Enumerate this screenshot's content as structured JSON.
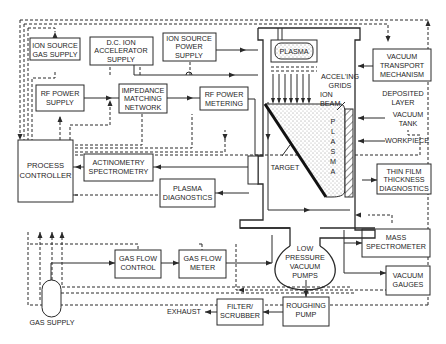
{
  "diagram": {
    "blocks": {
      "ion_source_gas_supply": [
        "ION SOURCE",
        "GAS SUPPLY"
      ],
      "dc_ion_accelerator_supply": [
        "D.C. ION",
        "ACCELERATOR",
        "SUPPLY"
      ],
      "ion_source_power_supply": [
        "ION SOURCE",
        "POWER",
        "SUPPLY"
      ],
      "rf_power_supply": [
        "RF POWER",
        "SUPPLY"
      ],
      "impedance_matching_network": [
        "IMPEDANCE",
        "MATCHING",
        "NETWORK"
      ],
      "rf_power_metering": [
        "RF POWER",
        "METERING"
      ],
      "vacuum_transport_mechanism": [
        "VACUUM",
        "TRANSPORT",
        "MECHANISM"
      ],
      "process_controller": [
        "PROCESS",
        "CONTROLLER"
      ],
      "actinometry_spectrometry": [
        "ACTINOMETRY",
        "SPECTROMETRY"
      ],
      "plasma_diagnostics": [
        "PLASMA",
        "DIAGNOSTICS"
      ],
      "thin_film_thickness_diagnostics": [
        "THIN FILM",
        "THICKNESS",
        "DIAGNOSTICS"
      ],
      "mass_spectrometer": [
        "MASS",
        "SPECTROMETER"
      ],
      "vacuum_gauges": [
        "VACUUM",
        "GAUGES"
      ],
      "gas_flow_control": [
        "GAS FLOW",
        "CONTROL"
      ],
      "gas_flow_meter": [
        "GAS FLOW",
        "METER"
      ],
      "low_pressure_vacuum_pumps": [
        "LOW",
        "PRESSURE",
        "VACUUM",
        "PUMPS"
      ],
      "roughing_pump": [
        "ROUGHING",
        "PUMP"
      ],
      "filter_scrubber": [
        "FILTER/",
        "SCRUBBER"
      ]
    },
    "labels": {
      "plasma_source": "PLASMA",
      "accel_grids": [
        "ACCEL'ING",
        "GRIDS"
      ],
      "ion_beam": [
        "ION",
        "BEAM"
      ],
      "deposited_layer": [
        "DEPOSITED",
        "LAYER"
      ],
      "vacuum_tank": [
        "VACUUM",
        "TANK"
      ],
      "workpiece": "WORKPIECE",
      "target": "TARGET",
      "plasma_vertical": [
        "P",
        "L",
        "A",
        "S",
        "M",
        "A"
      ],
      "exhaust": "EXHAUST",
      "gas_supply": "GAS SUPPLY"
    }
  }
}
